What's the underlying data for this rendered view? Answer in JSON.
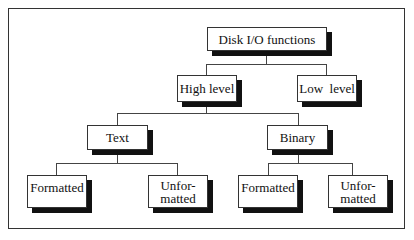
{
  "diagram": {
    "type": "tree",
    "root": {
      "label": "Disk I/O functions",
      "children": [
        {
          "label": "High level",
          "children": [
            {
              "label": "Text",
              "children": [
                {
                  "label": "Formatted"
                },
                {
                  "label": "Unfor-\nmatted"
                }
              ]
            },
            {
              "label": "Binary",
              "children": [
                {
                  "label": "Formatted"
                },
                {
                  "label": "Unfor-\nmatted"
                }
              ]
            }
          ]
        },
        {
          "label": "Low  level"
        }
      ]
    }
  },
  "nodes": {
    "root": "Disk I/O functions",
    "high": "High level",
    "low": "Low  level",
    "text": "Text",
    "binary": "Binary",
    "text_formatted": "Formatted",
    "text_unformatted_1": "Unfor-",
    "text_unformatted_2": "matted",
    "binary_formatted": "Formatted",
    "binary_unformatted_1": "Unfor-",
    "binary_unformatted_2": "matted"
  },
  "colors": {
    "border": "#333333",
    "shadow": "#111111",
    "background": "#ffffff"
  }
}
